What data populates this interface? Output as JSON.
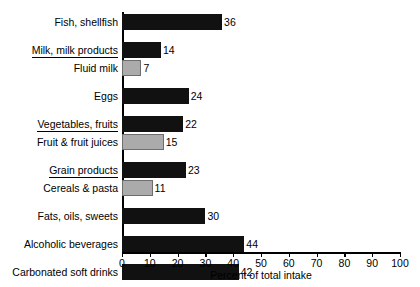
{
  "chart_data": {
    "type": "bar",
    "orientation": "horizontal",
    "title": "",
    "xlabel": "Percent of total intake",
    "ylabel": "",
    "xlim": [
      0,
      100
    ],
    "xticks": [
      0,
      10,
      20,
      30,
      40,
      50,
      60,
      70,
      80,
      90,
      100
    ],
    "grid": false,
    "legend": null,
    "categories": [
      "Fish, shellfish",
      "Milk, milk products",
      "Fluid milk",
      "Eggs",
      "Vegetables, fruits",
      "Fruit & fruit juices",
      "Grain products",
      "Cereals & pasta",
      "Fats, oils, sweets",
      "Alcoholic beverages",
      "Carbonated soft drinks"
    ],
    "values": [
      36,
      14,
      7,
      24,
      22,
      15,
      23,
      11,
      30,
      44,
      42
    ],
    "bars": [
      {
        "label": "Fish, shellfish",
        "value": 36,
        "style": "dark",
        "underline": false,
        "group_start": true
      },
      {
        "label": "Milk, milk products",
        "value": 14,
        "style": "dark",
        "underline": true,
        "group_start": true
      },
      {
        "label": "Fluid milk",
        "value": 7,
        "style": "light",
        "underline": false,
        "group_start": false
      },
      {
        "label": "Eggs",
        "value": 24,
        "style": "dark",
        "underline": false,
        "group_start": true
      },
      {
        "label": "Vegetables, fruits",
        "value": 22,
        "style": "dark",
        "underline": true,
        "group_start": true
      },
      {
        "label": "Fruit & fruit juices",
        "value": 15,
        "style": "light",
        "underline": false,
        "group_start": false
      },
      {
        "label": "Grain products",
        "value": 23,
        "style": "dark",
        "underline": true,
        "group_start": true
      },
      {
        "label": "Cereals & pasta",
        "value": 11,
        "style": "light",
        "underline": false,
        "group_start": false
      },
      {
        "label": "Fats, oils, sweets",
        "value": 30,
        "style": "dark",
        "underline": false,
        "group_start": true
      },
      {
        "label": "Alcoholic beverages",
        "value": 44,
        "style": "dark",
        "underline": false,
        "group_start": true
      },
      {
        "label": "Carbonated soft drinks",
        "value": 42,
        "style": "dark",
        "underline": false,
        "group_start": true
      }
    ],
    "colors": {
      "dark_bar": "#111111",
      "light_bar": "#ababab",
      "axis": "#000000",
      "background": "#ffffff",
      "text": "#000000"
    }
  }
}
